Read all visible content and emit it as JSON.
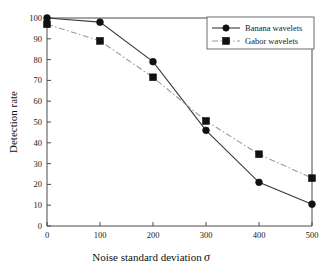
{
  "chart_data": {
    "type": "line",
    "title": "",
    "subtitle": "",
    "xlabel": "Noise standard deviation",
    "xlabel_symbol": "σ",
    "ylabel": "Detection rate",
    "x": [
      0,
      100,
      200,
      300,
      400,
      500
    ],
    "xlim": [
      0,
      500
    ],
    "ylim": [
      0,
      100
    ],
    "xticks": [
      "0",
      "100",
      "200",
      "300",
      "400",
      "500"
    ],
    "yticks": [
      "0",
      "10",
      "20",
      "30",
      "40",
      "50",
      "60",
      "70",
      "80",
      "90",
      "100"
    ],
    "grid": false,
    "legend_position": "top-right",
    "series": [
      {
        "name": "Banana wavelets",
        "marker": "circle",
        "linestyle": "solid",
        "color": "#3a3a3a",
        "marker_color": "#111111",
        "values": [
          100,
          98,
          79,
          46,
          21,
          10.5
        ]
      },
      {
        "name": "Gabor wavelets",
        "marker": "square",
        "linestyle": "dashdot",
        "color": "#9a9a9a",
        "marker_color": "#111111",
        "values": [
          97,
          89,
          71.5,
          50.5,
          34.5,
          23
        ]
      }
    ],
    "annotations": []
  },
  "legend": {
    "entries": [
      {
        "label": "Banana wavelets"
      },
      {
        "label": "Gabor wavelets"
      }
    ]
  },
  "axes": {
    "x_tick_labels": [
      "0",
      "100",
      "200",
      "300",
      "400",
      "500"
    ],
    "y_tick_labels": [
      "0",
      "10",
      "20",
      "30",
      "40",
      "50",
      "60",
      "70",
      "80",
      "90",
      "100"
    ],
    "x_title": "Noise standard deviation",
    "x_title_symbol": "σ",
    "y_title": "Detection rate"
  },
  "colors": {
    "banana_line": "#3a3a3a",
    "gabor_line": "#9a9a9a",
    "marker": "#111111",
    "frame": "#4a4a4a",
    "background": "#ffffff"
  }
}
